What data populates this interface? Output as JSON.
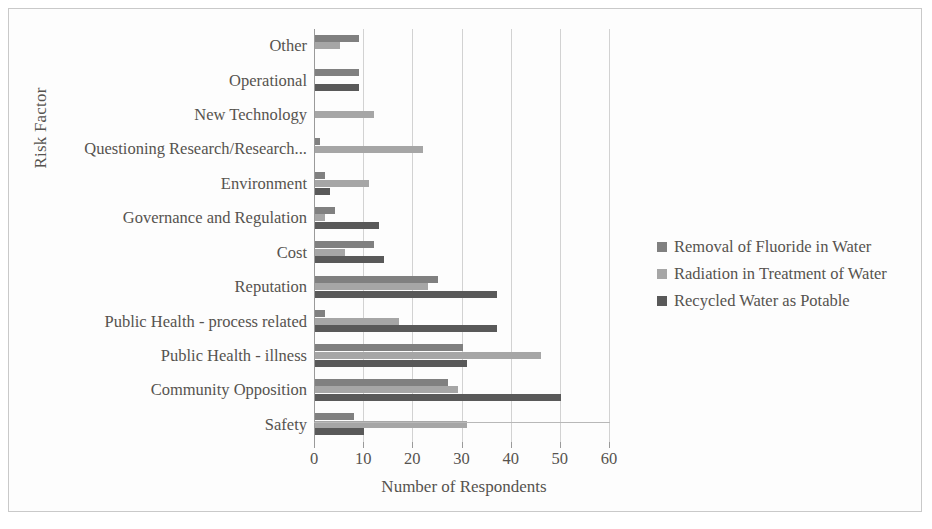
{
  "axes": {
    "y_title": "Risk Factor",
    "x_title": "Number of Respondents",
    "x_ticks": [
      "0",
      "10",
      "20",
      "30",
      "40",
      "50",
      "60"
    ]
  },
  "legend": {
    "items": [
      {
        "label": "Removal of Fluoride in Water",
        "color": "#808080"
      },
      {
        "label": "Radiation in Treatment of Water",
        "color": "#a6a6a6"
      },
      {
        "label": "Recycled Water as Potable",
        "color": "#595959"
      }
    ]
  },
  "categories": [
    "Other",
    "Operational",
    "New Technology",
    "Questioning Research/Research...",
    "Environment",
    "Governance and Regulation",
    "Cost",
    "Reputation",
    "Public Health - process related",
    "Public Health - illness",
    "Community Opposition",
    "Safety"
  ],
  "chart_data": {
    "type": "bar",
    "orientation": "horizontal",
    "title": "",
    "xlabel": "Number of Respondents",
    "ylabel": "Risk Factor",
    "xlim": [
      0,
      60
    ],
    "xticks": [
      0,
      10,
      20,
      30,
      40,
      50,
      60
    ],
    "grid": "vertical",
    "legend_position": "right",
    "categories": [
      "Other",
      "Operational",
      "New Technology",
      "Questioning Research/Research...",
      "Environment",
      "Governance and Regulation",
      "Cost",
      "Reputation",
      "Public Health - process related",
      "Public Health - illness",
      "Community Opposition",
      "Safety"
    ],
    "series": [
      {
        "name": "Removal of Fluoride in Water",
        "color": "#808080",
        "values": [
          9,
          9,
          0,
          1,
          2,
          4,
          12,
          25,
          2,
          30,
          27,
          8
        ]
      },
      {
        "name": "Radiation in Treatment of Water",
        "color": "#a6a6a6",
        "values": [
          5,
          0,
          12,
          22,
          11,
          2,
          6,
          23,
          17,
          46,
          29,
          31
        ]
      },
      {
        "name": "Recycled Water as Potable",
        "color": "#595959",
        "values": [
          0,
          9,
          0,
          0,
          3,
          13,
          14,
          37,
          37,
          31,
          50,
          10
        ]
      }
    ]
  }
}
